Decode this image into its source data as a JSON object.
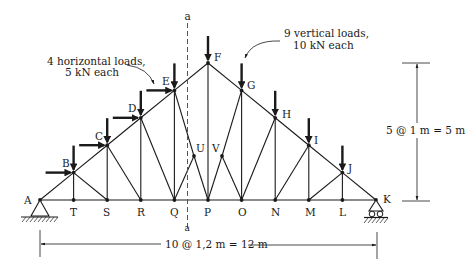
{
  "diagram": {
    "annotations": {
      "horizontal_loads": [
        "4 horizontal loads,",
        "5 kN each"
      ],
      "vertical_loads": [
        "9 vertical loads,",
        "10 kN each"
      ],
      "height_dimension": "5 @ 1 m = 5 m",
      "span_dimension": "10 @ 1,2 m = 12 m",
      "section_label_top": "a",
      "section_label_bottom": "a"
    },
    "joints": {
      "A": [
        40,
        200
      ],
      "T": [
        73.6,
        200
      ],
      "S": [
        107.2,
        200
      ],
      "R": [
        140.8,
        200
      ],
      "Q": [
        174.4,
        200
      ],
      "P": [
        208,
        200
      ],
      "O": [
        241.6,
        200
      ],
      "N": [
        275.2,
        200
      ],
      "M": [
        308.8,
        200
      ],
      "L": [
        342.4,
        200
      ],
      "K": [
        376,
        200
      ],
      "B": [
        73.6,
        172.6
      ],
      "C": [
        107.2,
        145.2
      ],
      "D": [
        140.8,
        117.8
      ],
      "E": [
        174.4,
        90.4
      ],
      "F": [
        208,
        63
      ],
      "G": [
        241.6,
        90.4
      ],
      "H": [
        275.2,
        117.8
      ],
      "I": [
        308.8,
        145.2
      ],
      "J": [
        342.4,
        172.6
      ],
      "U": [
        194,
        156
      ],
      "V": [
        222,
        156
      ]
    },
    "members": [
      [
        "A",
        "T"
      ],
      [
        "T",
        "S"
      ],
      [
        "S",
        "R"
      ],
      [
        "R",
        "Q"
      ],
      [
        "Q",
        "P"
      ],
      [
        "P",
        "O"
      ],
      [
        "O",
        "N"
      ],
      [
        "N",
        "M"
      ],
      [
        "M",
        "L"
      ],
      [
        "L",
        "K"
      ],
      [
        "A",
        "B"
      ],
      [
        "B",
        "C"
      ],
      [
        "C",
        "D"
      ],
      [
        "D",
        "E"
      ],
      [
        "E",
        "F"
      ],
      [
        "F",
        "G"
      ],
      [
        "G",
        "H"
      ],
      [
        "H",
        "I"
      ],
      [
        "I",
        "J"
      ],
      [
        "J",
        "K"
      ],
      [
        "B",
        "T"
      ],
      [
        "C",
        "S"
      ],
      [
        "D",
        "R"
      ],
      [
        "E",
        "Q"
      ],
      [
        "F",
        "P"
      ],
      [
        "G",
        "O"
      ],
      [
        "H",
        "N"
      ],
      [
        "I",
        "M"
      ],
      [
        "J",
        "L"
      ],
      [
        "B",
        "S"
      ],
      [
        "C",
        "R"
      ],
      [
        "D",
        "Q"
      ],
      [
        "E",
        "U"
      ],
      [
        "U",
        "P"
      ],
      [
        "U",
        "Q"
      ],
      [
        "G",
        "V"
      ],
      [
        "V",
        "P"
      ],
      [
        "V",
        "O"
      ],
      [
        "H",
        "O"
      ],
      [
        "I",
        "N"
      ],
      [
        "J",
        "M"
      ]
    ],
    "joint_labels": [
      {
        "id": "A",
        "text": "A",
        "x": 24,
        "y": 204
      },
      {
        "id": "B",
        "text": "B",
        "x": 62,
        "y": 167
      },
      {
        "id": "C",
        "text": "C",
        "x": 95,
        "y": 140
      },
      {
        "id": "D",
        "text": "D",
        "x": 128,
        "y": 112
      },
      {
        "id": "E",
        "text": "E",
        "x": 162,
        "y": 85
      },
      {
        "id": "F",
        "text": "F",
        "x": 214,
        "y": 61
      },
      {
        "id": "G",
        "text": "G",
        "x": 247,
        "y": 89
      },
      {
        "id": "H",
        "text": "H",
        "x": 282,
        "y": 118
      },
      {
        "id": "I",
        "text": "I",
        "x": 314,
        "y": 144
      },
      {
        "id": "J",
        "text": "J",
        "x": 348,
        "y": 172
      },
      {
        "id": "K",
        "text": "K",
        "x": 383,
        "y": 203
      },
      {
        "id": "T",
        "text": "T",
        "x": 70,
        "y": 216
      },
      {
        "id": "S",
        "text": "S",
        "x": 103,
        "y": 216
      },
      {
        "id": "R",
        "text": "R",
        "x": 137,
        "y": 216
      },
      {
        "id": "Q",
        "text": "Q",
        "x": 170,
        "y": 216
      },
      {
        "id": "P",
        "text": "P",
        "x": 204,
        "y": 216
      },
      {
        "id": "O",
        "text": "O",
        "x": 238,
        "y": 216
      },
      {
        "id": "N",
        "text": "N",
        "x": 271,
        "y": 216
      },
      {
        "id": "M",
        "text": "M",
        "x": 305,
        "y": 216
      },
      {
        "id": "L",
        "text": "L",
        "x": 339,
        "y": 216
      },
      {
        "id": "U",
        "text": "U",
        "x": 196,
        "y": 152
      },
      {
        "id": "V",
        "text": "V",
        "x": 212,
        "y": 152
      }
    ],
    "vertical_loads": [
      "B",
      "C",
      "D",
      "E",
      "F",
      "G",
      "H",
      "I",
      "J"
    ],
    "horizontal_loads": [
      "B",
      "C",
      "D",
      "E"
    ],
    "load_values": {
      "horizontal_kN": 5,
      "vertical_kN": 10,
      "horizontal_count": 4,
      "vertical_count": 9
    },
    "geometry": {
      "panels": 10,
      "panel_width_m": 1.2,
      "span_m": 12,
      "height_m": 5,
      "height_step_m": 1
    }
  }
}
